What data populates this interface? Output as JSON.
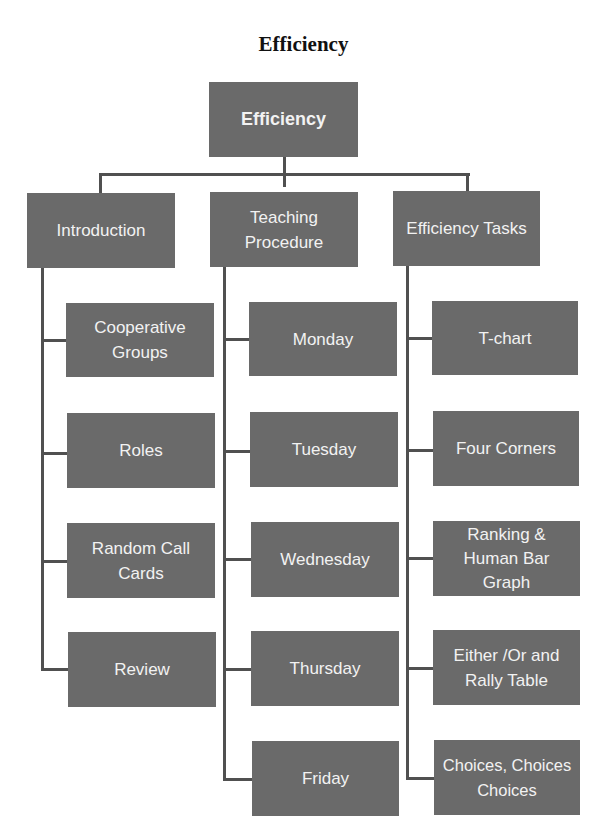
{
  "title": "Efficiency",
  "root": {
    "label": "Efficiency"
  },
  "columns": [
    {
      "label": "Introduction",
      "children": [
        {
          "label": "Cooperative\nGroups"
        },
        {
          "label": "Roles"
        },
        {
          "label": "Random Call\nCards"
        },
        {
          "label": "Review"
        }
      ]
    },
    {
      "label": "Teaching\nProcedure",
      "children": [
        {
          "label": "Monday"
        },
        {
          "label": "Tuesday"
        },
        {
          "label": "Wednesday"
        },
        {
          "label": "Thursday"
        },
        {
          "label": "Friday"
        }
      ]
    },
    {
      "label": "Efficiency Tasks",
      "children": [
        {
          "label": "T-chart"
        },
        {
          "label": "Four Corners"
        },
        {
          "label": "Ranking &\nHuman Bar\nGraph"
        },
        {
          "label": "Either /Or and\nRally Table"
        },
        {
          "label": "Choices, Choices\nChoices"
        }
      ]
    }
  ],
  "colors": {
    "box_fill": "#6a6a6a",
    "box_text": "#f2f2f2",
    "connector": "#505050"
  }
}
